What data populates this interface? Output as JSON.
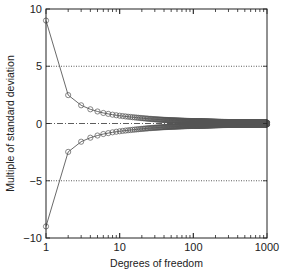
{
  "chart_data": {
    "type": "line",
    "title": "",
    "xlabel": "Degrees of freedom",
    "ylabel": "Multiple of standard deviation",
    "xscale": "log",
    "xlim": [
      1,
      1000
    ],
    "ylim": [
      -10,
      10
    ],
    "x_ticks": [
      1,
      10,
      100,
      1000
    ],
    "x_tick_labels": [
      "1",
      "10",
      "100",
      "1000"
    ],
    "y_ticks": [
      -10,
      -5,
      0,
      5,
      10
    ],
    "y_tick_labels": [
      "−10",
      "−5",
      "0",
      "5",
      "10"
    ],
    "reference_lines": [
      {
        "y": 5,
        "style": "dotted"
      },
      {
        "y": -5,
        "style": "dotted"
      },
      {
        "y": 0,
        "style": "dash-dot"
      }
    ],
    "grid": false,
    "legend": null,
    "marker": "open-circle",
    "series": [
      {
        "name": "upper",
        "x": [
          1,
          2,
          3,
          4,
          5,
          6,
          7,
          8,
          9,
          10,
          15,
          20,
          30,
          50,
          100,
          200,
          500,
          1000
        ],
        "values": [
          8.99,
          2.48,
          1.59,
          1.24,
          1.05,
          0.92,
          0.84,
          0.77,
          0.72,
          0.68,
          0.55,
          0.47,
          0.37,
          0.28,
          0.2,
          0.14,
          0.088,
          0.062
        ]
      },
      {
        "name": "lower",
        "x": [
          1,
          2,
          3,
          4,
          5,
          6,
          7,
          8,
          9,
          10,
          15,
          20,
          30,
          50,
          100,
          200,
          500,
          1000
        ],
        "values": [
          -8.99,
          -2.48,
          -1.59,
          -1.24,
          -1.05,
          -0.92,
          -0.84,
          -0.77,
          -0.72,
          -0.68,
          -0.55,
          -0.47,
          -0.37,
          -0.28,
          -0.2,
          -0.14,
          -0.088,
          -0.062
        ]
      }
    ]
  }
}
